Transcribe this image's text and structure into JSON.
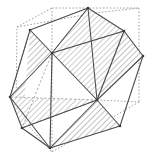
{
  "figure": {
    "type": "line-diagram",
    "width": 152,
    "height": 160,
    "background_color": "#ffffff",
    "solid_stroke_color": "#4a4a4a",
    "dashed_stroke_color": "#9a9a9a",
    "hatch_color": "#8d8d8d",
    "hatch_background": "#ffffff",
    "solid_stroke_width": 1.0,
    "dashed_stroke_width": 0.8,
    "hatch_spacing": 3,
    "hatch_angle_deg": 45,
    "vertex_dot_color": "#3a3a3a"
  },
  "chart_data": {
    "type": "scatter",
    "xlabel": "",
    "ylabel": "",
    "xlim": [
      0,
      152
    ],
    "ylim": [
      0,
      160
    ],
    "grid": false,
    "legend": "none",
    "annotations": [
      "Dashed grey lines trace the circumscribing cube (front and hidden edges).",
      "Solid dark lines trace the inscribed polyhedron's edges.",
      "Diagonally hatched regions mark selected faces of the polyhedron."
    ],
    "cube_vertices": [
      {
        "name": "cube-front-top-left",
        "x": 17,
        "y": 27
      },
      {
        "name": "cube-front-top-right",
        "x": 95,
        "y": 13
      },
      {
        "name": "cube-front-bottom-right",
        "x": 97,
        "y": 100
      },
      {
        "name": "cube-front-bottom-left",
        "x": 16,
        "y": 112
      },
      {
        "name": "cube-back-top-left",
        "x": 52,
        "y": 8
      },
      {
        "name": "cube-back-top-right",
        "x": 139,
        "y": 8
      },
      {
        "name": "cube-back-bottom-right",
        "x": 139,
        "y": 102
      },
      {
        "name": "cube-back-bottom-left",
        "x": 52,
        "y": 152
      }
    ],
    "cube_edges": [
      [
        0,
        1
      ],
      [
        1,
        2
      ],
      [
        2,
        3
      ],
      [
        3,
        0
      ],
      [
        4,
        5
      ],
      [
        5,
        6
      ],
      [
        6,
        7
      ],
      [
        7,
        4
      ],
      [
        0,
        4
      ],
      [
        1,
        5
      ],
      [
        2,
        6
      ],
      [
        3,
        7
      ]
    ],
    "polyhedron_vertices": [
      {
        "name": "v-top",
        "x": 88,
        "y": 8
      },
      {
        "name": "v-upper-left",
        "x": 30,
        "y": 30
      },
      {
        "name": "v-upper-right",
        "x": 124,
        "y": 31
      },
      {
        "name": "v-center-left",
        "x": 52,
        "y": 53
      },
      {
        "name": "v-far-right",
        "x": 143,
        "y": 56
      },
      {
        "name": "v-left",
        "x": 10,
        "y": 97
      },
      {
        "name": "v-center-right",
        "x": 97,
        "y": 100
      },
      {
        "name": "v-lower-left",
        "x": 22,
        "y": 128
      },
      {
        "name": "v-lower-right",
        "x": 120,
        "y": 126
      },
      {
        "name": "v-bottom",
        "x": 50,
        "y": 148
      }
    ],
    "polyhedron_edges": [
      [
        "v-top",
        "v-upper-left"
      ],
      [
        "v-top",
        "v-upper-right"
      ],
      [
        "v-top",
        "v-center-left"
      ],
      [
        "v-top",
        "v-center-right"
      ],
      [
        "v-upper-left",
        "v-center-left"
      ],
      [
        "v-upper-left",
        "v-left"
      ],
      [
        "v-upper-right",
        "v-center-left"
      ],
      [
        "v-upper-right",
        "v-far-right"
      ],
      [
        "v-upper-right",
        "v-center-right"
      ],
      [
        "v-center-left",
        "v-left"
      ],
      [
        "v-center-left",
        "v-center-right"
      ],
      [
        "v-center-left",
        "v-bottom"
      ],
      [
        "v-far-right",
        "v-center-right"
      ],
      [
        "v-far-right",
        "v-lower-right"
      ],
      [
        "v-left",
        "v-lower-left"
      ],
      [
        "v-left",
        "v-bottom"
      ],
      [
        "v-center-right",
        "v-lower-right"
      ],
      [
        "v-center-right",
        "v-lower-left"
      ],
      [
        "v-center-right",
        "v-bottom"
      ],
      [
        "v-lower-left",
        "v-bottom"
      ],
      [
        "v-lower-right",
        "v-bottom"
      ]
    ],
    "hatched_faces": [
      {
        "name": "face-upper-left",
        "points": "30,30 52,53 10,97 22,128"
      },
      {
        "name": "face-center",
        "points": "52,53 88,8 124,31 97,100"
      },
      {
        "name": "face-lower-right",
        "points": "97,100 120,126 50,148"
      },
      {
        "name": "face-left-lower",
        "points": "10,97 22,128 97,100"
      },
      {
        "name": "face-right-sliver",
        "points": "124,31 143,56 97,100"
      }
    ]
  }
}
